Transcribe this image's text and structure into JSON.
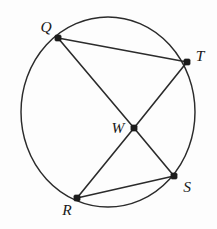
{
  "figure": {
    "background_color": "#fdfdfd",
    "stroke_color": "#2b2b2b",
    "label_color": "#1a1a1a",
    "circle": {
      "center_x": 108,
      "center_y": 112,
      "radius_x": 87,
      "radius_y": 95
    },
    "points": [
      {
        "id": "Q",
        "label": "Q",
        "x": 58,
        "y": 38,
        "label_x": 46,
        "label_y": 28,
        "position": "upper-left"
      },
      {
        "id": "T",
        "label": "T",
        "x": 187,
        "y": 62,
        "label_x": 200,
        "label_y": 57,
        "position": "upper-right"
      },
      {
        "id": "W",
        "label": "W",
        "x": 134,
        "y": 128,
        "label_x": 118,
        "label_y": 129,
        "position": "center-interior"
      },
      {
        "id": "S",
        "label": "S",
        "x": 174,
        "y": 176,
        "label_x": 187,
        "label_y": 188,
        "position": "lower-right"
      },
      {
        "id": "R",
        "label": "R",
        "x": 77,
        "y": 198,
        "label_x": 67,
        "label_y": 211,
        "position": "lower-left"
      }
    ],
    "segments": [
      {
        "id": "QT",
        "from": "Q",
        "to": "T",
        "x1": 58,
        "y1": 38,
        "x2": 187,
        "y2": 62,
        "label": "Q to T"
      },
      {
        "id": "QW",
        "from": "Q",
        "to": "W",
        "x1": 58,
        "y1": 38,
        "x2": 134,
        "y2": 128,
        "label": "Q to W"
      },
      {
        "id": "WS",
        "from": "W",
        "to": "S",
        "x1": 134,
        "y1": 128,
        "x2": 174,
        "y2": 176,
        "label": "W to S"
      },
      {
        "id": "TW",
        "from": "T",
        "to": "W",
        "x1": 187,
        "y1": 62,
        "x2": 134,
        "y2": 128,
        "label": "T to W"
      },
      {
        "id": "WR",
        "from": "W",
        "to": "R",
        "x1": 134,
        "y1": 128,
        "x2": 77,
        "y2": 198,
        "label": "W to R"
      },
      {
        "id": "RS",
        "from": "R",
        "to": "S",
        "x1": 77,
        "y1": 198,
        "x2": 174,
        "y2": 176,
        "label": "R to S"
      }
    ],
    "dot_radius": 3.1
  }
}
